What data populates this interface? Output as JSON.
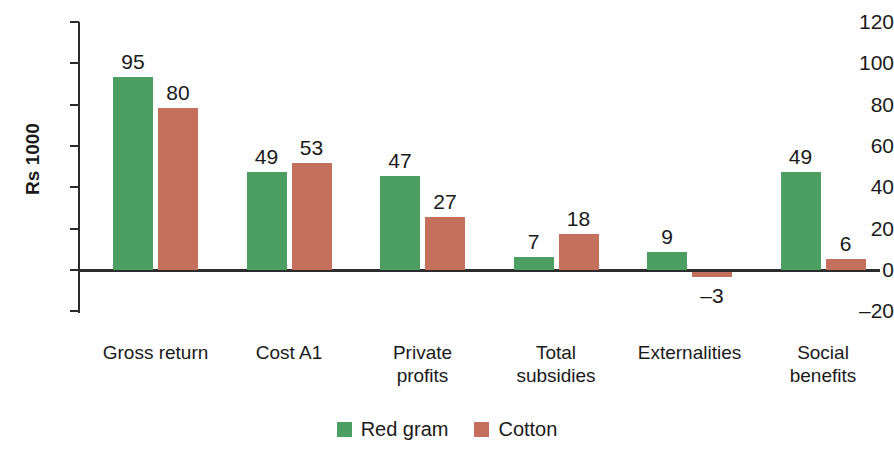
{
  "chart_data": {
    "type": "bar",
    "title": "",
    "xlabel": "",
    "ylabel": "Rs 1000",
    "ylim": [
      -20,
      120
    ],
    "yticks": [
      120,
      100,
      80,
      60,
      40,
      20,
      0,
      -20
    ],
    "ytick_labels": [
      "120",
      "100",
      "80",
      "60",
      "40",
      "20",
      "0",
      "–20"
    ],
    "grid": false,
    "legend_position": "bottom-center",
    "categories": [
      "Gross return",
      "Cost A1",
      "Private profits",
      "Total subsidies",
      "Externalities",
      "Social benefits"
    ],
    "category_label_lines": [
      [
        "Gross return"
      ],
      [
        "Cost A1"
      ],
      [
        "Private",
        "profits"
      ],
      [
        "Total",
        "subsidies"
      ],
      [
        "Externalities"
      ],
      [
        "Social",
        "benefits"
      ]
    ],
    "series": [
      {
        "name": "Red gram",
        "color": "#4d9e62",
        "values": [
          95,
          49,
          47,
          7,
          9,
          49
        ],
        "value_labels": [
          "95",
          "49",
          "47",
          "7",
          "9",
          "49"
        ]
      },
      {
        "name": "Cotton",
        "color": "#c4705c",
        "values": [
          80,
          53,
          27,
          18,
          -3,
          6
        ],
        "value_labels": [
          "80",
          "53",
          "27",
          "18",
          "–3",
          "6"
        ]
      }
    ]
  },
  "axis": {
    "y_title": "Rs 1000"
  },
  "legend": {
    "items": [
      {
        "label": "Red gram",
        "color": "#4d9e62"
      },
      {
        "label": "Cotton",
        "color": "#c4705c"
      }
    ]
  },
  "colors": {
    "green": "#4d9e62",
    "red": "#c4705c",
    "axis": "#2b2b2b",
    "text": "#1a1a1a",
    "background": "#fefefe"
  }
}
